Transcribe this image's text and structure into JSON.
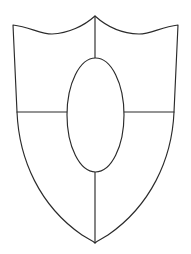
{
  "image": {
    "title": "Shield Outline Drawing",
    "description": "Black-and-white line drawing of a heraldic shield divided into quarters with a central oval inescutcheon",
    "width": 191,
    "height": 254,
    "background_color": "#ffffff",
    "line_color": "#2b2b2b",
    "line_width": 1.15,
    "fill_color": "#ffffff"
  },
  "geometry": {
    "shield": {
      "name": "shield-outline",
      "top_left_corner": [
        13,
        25
      ],
      "top_right_corner": [
        178,
        25
      ],
      "top_center_peak": [
        95,
        16
      ],
      "top_dip_left": [
        50,
        34
      ],
      "top_dip_right": [
        141,
        34
      ],
      "waist_left": [
        17,
        112
      ],
      "waist_right": [
        174,
        112
      ],
      "bottom_point": [
        95,
        243
      ],
      "path": "M 13 25 C 30 27 40 34 52 34 C 68 33.5 84 26 95 16 C 106 26 122 33.5 139 34 C 151 34 161 27 178 25 L 174 112 C 172 160 150 206 108 235 C 102 239 98 240 95 243 C 92 240 88 239 82 235 C 40 206 19 160 17 112 Z"
    },
    "center_line_upper": {
      "name": "vertical-divider-upper",
      "from": [
        95,
        16
      ],
      "to": [
        95,
        58
      ]
    },
    "center_line_lower": {
      "name": "vertical-divider-lower",
      "from": [
        95,
        172
      ],
      "to": [
        95,
        243
      ]
    },
    "fess_line_left": {
      "name": "horizontal-divider-left",
      "from": [
        17,
        112
      ],
      "to": [
        67,
        112
      ]
    },
    "fess_line_right": {
      "name": "horizontal-divider-right",
      "from": [
        124,
        112
      ],
      "to": [
        174,
        112
      ]
    },
    "inescutcheon": {
      "name": "center-oval",
      "center": [
        95.5,
        115
      ],
      "radius_x": 28.5,
      "radius_y": 57,
      "top": [
        95.5,
        58
      ],
      "bottom": [
        95.5,
        172
      ],
      "left": [
        67,
        115
      ],
      "right": [
        124,
        115
      ]
    }
  },
  "regions": [
    {
      "name": "chief-dexter",
      "label": "upper left quarter"
    },
    {
      "name": "chief-sinister",
      "label": "upper right quarter"
    },
    {
      "name": "base-dexter",
      "label": "lower left quarter"
    },
    {
      "name": "base-sinister",
      "label": "lower right quarter"
    },
    {
      "name": "inescutcheon",
      "label": "central oval"
    }
  ]
}
